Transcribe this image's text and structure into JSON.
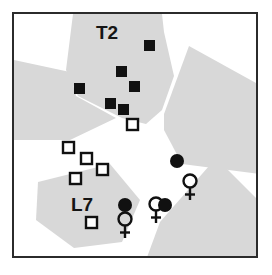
{
  "figure": {
    "background_color": "#ffffff",
    "frame_color": "#2b2b2b",
    "shade_color": "#d8d8d8",
    "marker_color": "#111111",
    "label_color": "#151515"
  },
  "labels": [
    {
      "name": "label-t2",
      "text": "T2",
      "x": 93,
      "y": 20
    },
    {
      "name": "label-l7",
      "text": "L7",
      "x": 68,
      "y": 192
    }
  ],
  "shaded_regions": [
    {
      "name": "region-top-center",
      "points": "59,0 148,0 150,18 160,62 148,96 132,110 108,104 64,82 52,56"
    },
    {
      "name": "region-left-wedge",
      "points": "0,46 56,58 62,82 102,104 56,126 0,126"
    },
    {
      "name": "region-top-right",
      "points": "175,32 244,70 246,160 168,150 150,116 150,100"
    },
    {
      "name": "region-bottom-left",
      "points": "24,168 96,150 126,186 108,228 60,234 22,206"
    },
    {
      "name": "region-bottom-right",
      "points": "146,208 202,144 246,188 246,246 132,246"
    }
  ],
  "filled_squares": [
    {
      "name": "filled-square-1",
      "x": 130,
      "y": 26,
      "size": 11
    },
    {
      "name": "filled-square-2",
      "x": 102,
      "y": 52,
      "size": 11
    },
    {
      "name": "filled-square-3",
      "x": 115,
      "y": 67,
      "size": 11
    },
    {
      "name": "filled-square-4",
      "x": 60,
      "y": 69,
      "size": 11
    },
    {
      "name": "filled-square-5",
      "x": 91,
      "y": 84,
      "size": 11
    },
    {
      "name": "filled-square-6",
      "x": 104,
      "y": 90,
      "size": 11
    }
  ],
  "open_squares": [
    {
      "name": "open-square-1",
      "x": 113,
      "y": 105,
      "size": 11
    },
    {
      "name": "open-square-2",
      "x": 49,
      "y": 128,
      "size": 11
    },
    {
      "name": "open-square-3",
      "x": 67,
      "y": 139,
      "size": 11
    },
    {
      "name": "open-square-4",
      "x": 83,
      "y": 150,
      "size": 11
    },
    {
      "name": "open-square-5",
      "x": 56,
      "y": 159,
      "size": 11
    },
    {
      "name": "open-square-6",
      "x": 72,
      "y": 203,
      "size": 11
    }
  ],
  "filled_circles": [
    {
      "name": "filled-circle-1",
      "cx": 163,
      "cy": 147,
      "r": 7
    },
    {
      "name": "filled-circle-2",
      "cx": 111,
      "cy": 191,
      "r": 7
    },
    {
      "name": "filled-circle-3",
      "cx": 151,
      "cy": 191,
      "r": 7
    }
  ],
  "female_symbols": [
    {
      "name": "female-symbol-right",
      "cx": 176,
      "cy": 167,
      "r": 7
    },
    {
      "name": "female-symbol-left",
      "cx": 111,
      "cy": 205,
      "r": 7
    },
    {
      "name": "female-symbol-center",
      "cx": 142,
      "cy": 190,
      "r": 7
    }
  ],
  "legend_semantics": {
    "filled_square": "marked male of group T2",
    "open_square": "unmarked individual of group L7",
    "filled_circle": "marked female",
    "female_symbol": "female sex indicator"
  }
}
